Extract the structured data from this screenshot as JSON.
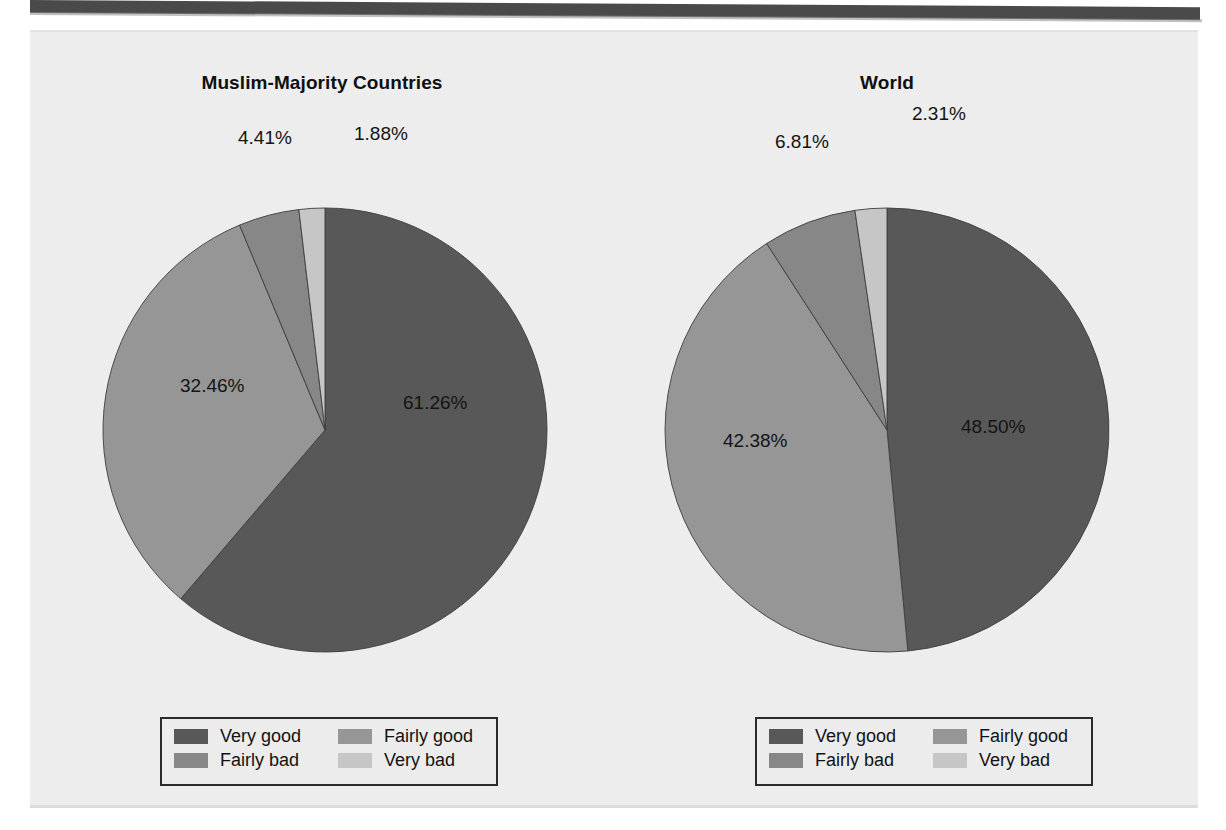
{
  "figure": {
    "background_color": "#ededed",
    "charts": [
      {
        "id": "muslim-majority-countries",
        "title": "Muslim-Majority Countries",
        "labels": [
          "61.26%",
          "32.46%",
          "4.41%",
          "1.88%"
        ]
      },
      {
        "id": "world",
        "title": "World",
        "labels": [
          "48.50%",
          "42.38%",
          "6.81%",
          "2.31%"
        ]
      }
    ],
    "legend": {
      "items": [
        {
          "label": "Very good",
          "color": "#585858"
        },
        {
          "label": "Fairly good",
          "color": "#969696"
        },
        {
          "label": "Fairly bad",
          "color": "#878787"
        },
        {
          "label": "Very bad",
          "color": "#c6c6c6"
        }
      ]
    }
  },
  "chart_data": [
    {
      "type": "pie",
      "title": "Muslim-Majority Countries",
      "categories": [
        "Very good",
        "Fairly good",
        "Fairly bad",
        "Very bad"
      ],
      "values": [
        61.26,
        32.46,
        4.41,
        1.88
      ],
      "value_labels": [
        "61.26%",
        "32.46%",
        "4.41%",
        "1.88%"
      ],
      "colors": [
        "#585858",
        "#969696",
        "#878787",
        "#c6c6c6"
      ],
      "units": "percent",
      "start_angle_deg": 0,
      "direction": "clockwise",
      "legend_position": "bottom",
      "grid": false
    },
    {
      "type": "pie",
      "title": "World",
      "categories": [
        "Very good",
        "Fairly good",
        "Fairly bad",
        "Very bad"
      ],
      "values": [
        48.5,
        42.38,
        6.81,
        2.31
      ],
      "value_labels": [
        "48.50%",
        "42.38%",
        "6.81%",
        "2.31%"
      ],
      "colors": [
        "#585858",
        "#969696",
        "#878787",
        "#c6c6c6"
      ],
      "units": "percent",
      "start_angle_deg": 0,
      "direction": "clockwise",
      "legend_position": "bottom",
      "grid": false
    }
  ]
}
